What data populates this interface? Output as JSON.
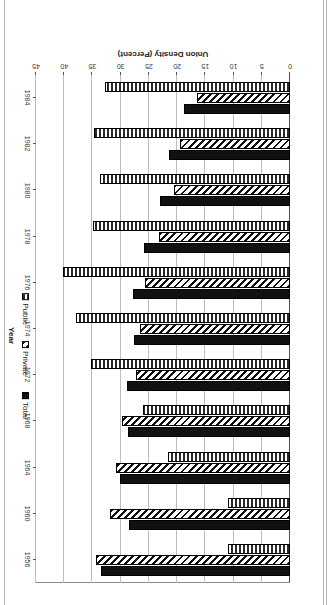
{
  "chart_data": {
    "type": "bar",
    "orientation": "horizontal",
    "title": "",
    "xlabel": "Year",
    "ylabel": "Union Density (Percent)",
    "ylim": [
      0,
      45
    ],
    "ytick_values": [
      0,
      5,
      10,
      15,
      20,
      25,
      30,
      35,
      40,
      45
    ],
    "ytick_labels": [
      "0",
      "5",
      "10",
      "15",
      "20",
      "25",
      "30",
      "35",
      "40",
      "45"
    ],
    "grid": true,
    "legend_position": "right",
    "categories": [
      "1956",
      "1960",
      "1964",
      "1968",
      "1972",
      "1974",
      "1976",
      "1978",
      "1980",
      "1982",
      "1984"
    ],
    "series": [
      {
        "name": "Total",
        "pattern": "solid-black",
        "color": "#111111",
        "values": [
          33.4,
          28.6,
          30.2,
          28.7,
          28.8,
          27.7,
          27.9,
          25.8,
          23.0,
          21.4,
          18.8
        ]
      },
      {
        "name": "Private",
        "pattern": "diagonal-hatch",
        "color": "#111111",
        "values": [
          34.3,
          31.9,
          30.8,
          29.8,
          27.2,
          26.6,
          25.7,
          23.2,
          20.6,
          19.4,
          16.5
        ]
      },
      {
        "name": "Public",
        "pattern": "vertical-stripes",
        "color": "#2a2a2a",
        "values": [
          11.0,
          11.0,
          21.6,
          26.1,
          35.2,
          38.0,
          40.2,
          34.9,
          33.6,
          34.8,
          32.8
        ]
      }
    ]
  },
  "legend": {
    "items": [
      {
        "label": "Total"
      },
      {
        "label": "Private"
      },
      {
        "label": "Public"
      }
    ]
  },
  "axes": {
    "value_axis_title": "Union Density (Percent)",
    "category_axis_title": "Year"
  }
}
